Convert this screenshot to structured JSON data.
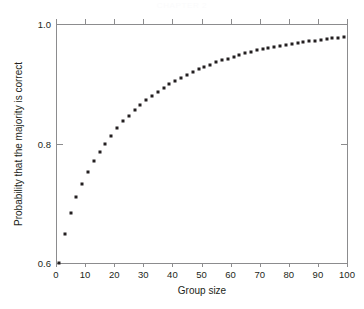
{
  "header": {
    "faint_text": "CHAPTER 2"
  },
  "chart_data": {
    "type": "scatter",
    "title": "",
    "subtitle": "",
    "xlabel": "Group size",
    "ylabel": "Probability that the majority is correct",
    "xlim": [
      0,
      100
    ],
    "ylim": [
      0.6,
      1.0
    ],
    "xticks": [
      0,
      10,
      20,
      30,
      40,
      50,
      60,
      70,
      80,
      90,
      100
    ],
    "xticklabels": [
      "0",
      "10",
      "20",
      "30",
      "40",
      "50",
      "60",
      "70",
      "80",
      "90",
      "100"
    ],
    "yticks": [
      0.6,
      0.8,
      1.0
    ],
    "yticklabels": [
      "0.6",
      "0.8",
      "1.0"
    ],
    "grid": false,
    "legend": null,
    "marker": "square",
    "marker_color": "#231f20",
    "marker_size_px": 3,
    "individual_competence": 0.6,
    "series": [
      {
        "name": "Probability majority correct (p = 0.6)",
        "x": [
          1,
          3,
          5,
          7,
          9,
          11,
          13,
          15,
          17,
          19,
          21,
          23,
          25,
          27,
          29,
          31,
          33,
          35,
          37,
          39,
          41,
          43,
          45,
          47,
          49,
          51,
          53,
          55,
          57,
          59,
          61,
          63,
          65,
          67,
          69,
          71,
          73,
          75,
          77,
          79,
          81,
          83,
          85,
          87,
          89,
          91,
          93,
          95,
          97,
          99
        ],
        "y": [
          0.6,
          0.648,
          0.683,
          0.71,
          0.733,
          0.753,
          0.77,
          0.786,
          0.8,
          0.813,
          0.826,
          0.837,
          0.846,
          0.856,
          0.864,
          0.872,
          0.88,
          0.887,
          0.893,
          0.899,
          0.905,
          0.91,
          0.915,
          0.92,
          0.924,
          0.928,
          0.932,
          0.936,
          0.939,
          0.942,
          0.945,
          0.948,
          0.951,
          0.953,
          0.956,
          0.958,
          0.96,
          0.962,
          0.964,
          0.965,
          0.967,
          0.968,
          0.97,
          0.971,
          0.972,
          0.974,
          0.975,
          0.976,
          0.977,
          0.979
        ]
      }
    ]
  }
}
